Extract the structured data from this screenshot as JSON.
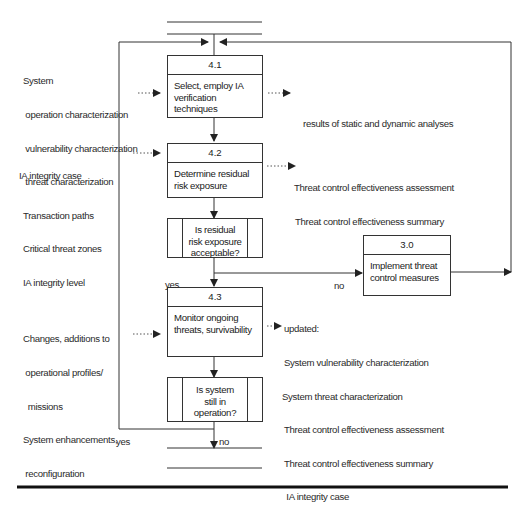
{
  "inputs": {
    "group_41": [
      "System",
      " operation characterization",
      " vulnerability characterization",
      " threat characterization",
      "Transaction paths",
      "Critical threat zones",
      "IA integrity level"
    ],
    "group_42": [
      "IA integrity case"
    ],
    "group_43": [
      "Changes, additions to",
      " operational profiles/",
      "  missions",
      "System enhancements,",
      " reconfiguration"
    ]
  },
  "processes": {
    "p41": {
      "id": "4.1",
      "label": "Select, employ IA\nverification\ntechniques"
    },
    "p42": {
      "id": "4.2",
      "label": "Determine residual\nrisk exposure"
    },
    "p43": {
      "id": "4.3",
      "label": "Monitor ongoing\nthreats, survivability"
    },
    "p30": {
      "id": "3.0",
      "label": "Implement threat\ncontrol measures"
    }
  },
  "decisions": {
    "d1": {
      "label": "Is  residual\nrisk exposure\nacceptable?"
    },
    "d2": {
      "label": "Is system\nstill in\noperation?"
    }
  },
  "outputs": {
    "out_41": [
      "results of static and dynamic analyses"
    ],
    "out_42": [
      "Threat control effectiveness assessment",
      "Threat control effectiveness summary"
    ],
    "out_43": [
      "updated:",
      "System vulnerability characterization",
      "System threat characterization",
      "Threat control effectiveness assessment",
      "Threat control effectiveness summary",
      " IA integrity case"
    ]
  },
  "branch_labels": {
    "d1_yes": "yes",
    "d1_no": "no",
    "d2_yes": "yes",
    "d2_no": "no"
  },
  "colors": {
    "line": "#333333",
    "background": "#ffffff",
    "text": "#2a2a2a"
  }
}
